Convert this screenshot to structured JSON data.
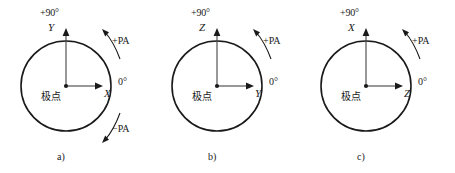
{
  "figure": {
    "background_color": "#ffffff",
    "stroke_color": "#1a1a1a",
    "panel_count": 3
  },
  "common": {
    "top_label": "+90°",
    "zero_label": "0°",
    "center_label": "极点",
    "pa_plus_label": "+PA",
    "pa_minus_label": "−PA"
  },
  "panels": [
    {
      "caption": "a)",
      "vertical_axis": "Y",
      "horizontal_axis": "X",
      "top_label": "+90°",
      "zero_label": "0°",
      "center_label": "极点",
      "pa_plus_label": "+PA",
      "pa_minus_label": "−PA",
      "has_pa_minus": true
    },
    {
      "caption": "b)",
      "vertical_axis": "Z",
      "horizontal_axis": "Y",
      "top_label": "+90°",
      "zero_label": "0°",
      "center_label": "极点",
      "pa_plus_label": "+PA",
      "pa_minus_label": "",
      "has_pa_minus": false
    },
    {
      "caption": "c)",
      "vertical_axis": "X",
      "horizontal_axis": "Z",
      "top_label": "+90°",
      "zero_label": "0°",
      "center_label": "极点",
      "pa_plus_label": "+PA",
      "pa_minus_label": "",
      "has_pa_minus": false
    }
  ]
}
